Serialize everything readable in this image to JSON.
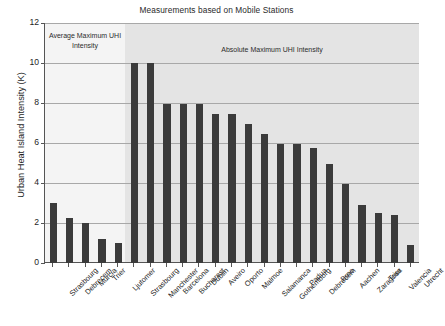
{
  "chart_data": {
    "type": "bar",
    "title": "Measurements based on Mobile Stations",
    "xlabel": "",
    "ylabel": "Urban Heat Island Intensity (K)",
    "ylim": [
      0,
      12
    ],
    "ytick_labels": [
      "0",
      "2",
      "4",
      "6",
      "8",
      "10",
      "12"
    ],
    "ytick_values": [
      0,
      2,
      4,
      6,
      8,
      10,
      12
    ],
    "grid": true,
    "legend_position": "none",
    "bar_color": "#3b3b3b",
    "categories": [
      "Strasbourg",
      "Debrecem",
      "Murcia",
      "Trier",
      "Ljutomer",
      "Strasbourg",
      "Manchester",
      "Barcelona",
      "Bucharest",
      "Dublin",
      "Aveiro",
      "Oporto",
      "Malmoe",
      "Salamanca",
      "Gothemborg",
      "Padua",
      "Debrecem",
      "Brno",
      "Aachen",
      "Zaragosa",
      "Trier",
      "Valencia",
      "Utrecht"
    ],
    "values": [
      3.0,
      2.25,
      2.0,
      1.2,
      1.0,
      10.0,
      10.0,
      7.95,
      7.95,
      7.95,
      7.45,
      7.45,
      6.95,
      6.45,
      5.95,
      5.95,
      5.75,
      4.95,
      3.95,
      2.9,
      2.5,
      2.4,
      0.9
    ],
    "annotations": [
      {
        "name": "average-maximum-region",
        "text": "Average Maximum UHI Intensity",
        "covers_categories": [
          0,
          4
        ],
        "background": "#f4f4f4"
      },
      {
        "name": "absolute-maximum-region",
        "text": "Absolute Maximum UHI Intensity",
        "covers_categories": [
          5,
          22
        ],
        "background": "#e4e4e4"
      }
    ]
  },
  "regions": {
    "average_label": "Average Maximum UHI Intensity",
    "absolute_label": "Absolute Maximum UHI Intensity"
  },
  "caption_fragment": ""
}
